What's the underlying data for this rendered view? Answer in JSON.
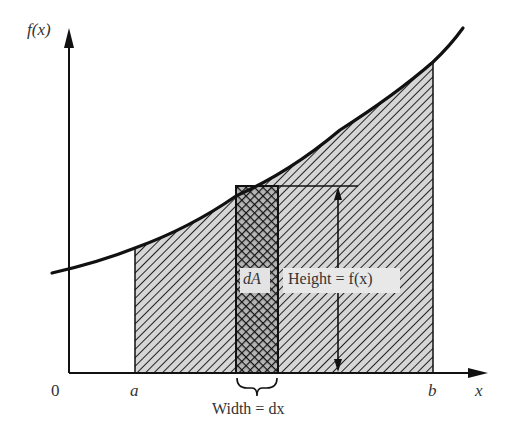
{
  "diagram": {
    "y_axis_label": "f(x)",
    "x_axis_label": "x",
    "origin_label": "0",
    "lower_bound_label": "a",
    "upper_bound_label": "b",
    "strip_label": "dA",
    "height_label": "Height = f(x)",
    "width_label": "Width = dx",
    "colors": {
      "ink": "#111111",
      "hatch_fill": "#d9d9d9",
      "label_box": "#e6e6e6",
      "background": "#ffffff"
    }
  }
}
